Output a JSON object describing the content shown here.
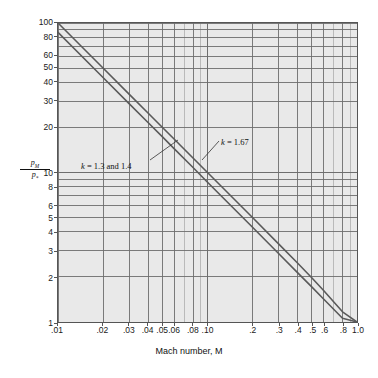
{
  "figure": {
    "background": "#ffffff",
    "plot_background": "#e9e9e9",
    "grid_color": "#6d6d6d",
    "minor_grid_color": "#9a9a9a",
    "curve_color": "#5a5a5a"
  },
  "axes": {
    "xlabel": "Mach number, M",
    "ylabel_numerator": "p",
    "ylabel_numerator_sub": "M",
    "ylabel_denominator": "p",
    "ylabel_denominator_sub": "*",
    "x_ticks": [
      {
        "value": 0.01,
        "label": ".01"
      },
      {
        "value": 0.02,
        "label": ".02"
      },
      {
        "value": 0.03,
        "label": ".03"
      },
      {
        "value": 0.04,
        "label": ".04"
      },
      {
        "value": 0.05,
        "label": ".05"
      },
      {
        "value": 0.06,
        "label": ".06"
      },
      {
        "value": 0.08,
        "label": ".08"
      },
      {
        "value": 0.1,
        "label": ".10"
      },
      {
        "value": 0.2,
        "label": ".2"
      },
      {
        "value": 0.3,
        "label": ".3"
      },
      {
        "value": 0.4,
        "label": ".4"
      },
      {
        "value": 0.5,
        "label": ".5"
      },
      {
        "value": 0.6,
        "label": ".6"
      },
      {
        "value": 0.8,
        "label": ".8"
      },
      {
        "value": 1.0,
        "label": "1.0"
      }
    ],
    "y_ticks": [
      {
        "value": 100,
        "label": "100"
      },
      {
        "value": 80,
        "label": "80"
      },
      {
        "value": 60,
        "label": "60"
      },
      {
        "value": 50,
        "label": "50"
      },
      {
        "value": 40,
        "label": "40"
      },
      {
        "value": 30,
        "label": "30"
      },
      {
        "value": 20,
        "label": "20"
      },
      {
        "value": 10,
        "label": "10"
      },
      {
        "value": 8,
        "label": "8"
      },
      {
        "value": 6,
        "label": "6"
      },
      {
        "value": 5,
        "label": "5"
      },
      {
        "value": 4,
        "label": "4"
      },
      {
        "value": 3,
        "label": "3"
      },
      {
        "value": 2,
        "label": "2"
      },
      {
        "value": 1,
        "label": "1"
      }
    ]
  },
  "annotations": [
    {
      "id": "k13",
      "text": "k = 1.3 and 1.4",
      "symbol": "k",
      "rest": " = 1.3 and 1.4",
      "leader": {
        "x1": 150,
        "y1": 160,
        "x2": 178,
        "y2": 140
      }
    },
    {
      "id": "k167",
      "text": "k = 1.67",
      "symbol": "k",
      "rest": " = 1.67",
      "leader": {
        "x1": 219,
        "y1": 141,
        "x2": 202,
        "y2": 160
      }
    }
  ],
  "chart_data": {
    "type": "line",
    "title": "",
    "subtitle": "",
    "xlabel": "Mach number, M",
    "ylabel": "p_M / p_*",
    "xscale": "log",
    "yscale": "log",
    "xlim": [
      0.01,
      1.0
    ],
    "ylim": [
      1,
      100
    ],
    "grid": true,
    "legend": "inline-annotations",
    "x_tick_labels": [
      ".01",
      ".02",
      ".03",
      ".04",
      ".05",
      ".06",
      ".08",
      ".10",
      ".2",
      ".3",
      ".4",
      ".5",
      ".6",
      ".8",
      "1.0"
    ],
    "y_tick_labels": [
      "100",
      "80",
      "60",
      "50",
      "40",
      "30",
      "20",
      "10",
      "8",
      "6",
      "5",
      "4",
      "3",
      "2",
      "1"
    ],
    "series": [
      {
        "name": "k = 1.3 and 1.4",
        "x": [
          0.01,
          0.02,
          0.03,
          0.04,
          0.05,
          0.06,
          0.08,
          0.1,
          0.2,
          0.3,
          0.4,
          0.5,
          0.6,
          0.8,
          1.0
        ],
        "values": [
          86.5,
          43.2,
          28.8,
          21.6,
          17.3,
          14.4,
          10.8,
          8.6,
          4.3,
          2.86,
          2.14,
          1.71,
          1.42,
          1.06,
          1.0
        ]
      },
      {
        "name": "k = 1.67",
        "x": [
          0.01,
          0.02,
          0.03,
          0.04,
          0.05,
          0.06,
          0.08,
          0.1,
          0.2,
          0.3,
          0.4,
          0.5,
          0.6,
          0.8,
          1.0
        ],
        "values": [
          100.0,
          50.0,
          33.3,
          25.0,
          20.0,
          16.7,
          12.5,
          10.0,
          5.0,
          3.32,
          2.48,
          1.97,
          1.62,
          1.17,
          1.0
        ]
      }
    ]
  }
}
